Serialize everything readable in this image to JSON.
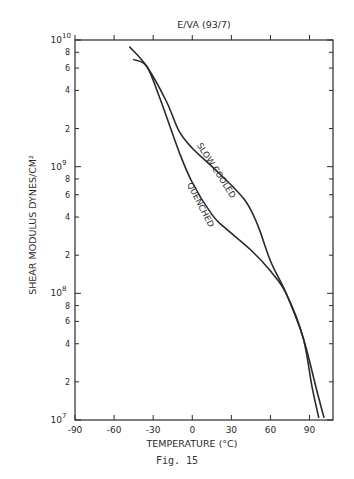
{
  "chart_data": {
    "type": "line",
    "title": "E/VA (93/7)",
    "xlabel": "TEMPERATURE (°C)",
    "ylabel": "SHEAR MODULUS DYNES/CM²",
    "xlim": [
      -90,
      108
    ],
    "ylim": [
      10000000.0,
      10000000000.0
    ],
    "yscale": "log",
    "grid": false,
    "x_ticks": [
      "-90",
      "-60",
      "-30",
      "0",
      "30",
      "60",
      "90"
    ],
    "x_tick_values": [
      -90,
      -60,
      -30,
      0,
      30,
      60,
      90
    ],
    "y_major_ticks": [
      {
        "value": 10000000.0,
        "label": "10",
        "exp": "7"
      },
      {
        "value": 100000000.0,
        "label": "10",
        "exp": "8"
      },
      {
        "value": 1000000000.0,
        "label": "10",
        "exp": "9"
      },
      {
        "value": 10000000000.0,
        "label": "10",
        "exp": "10"
      }
    ],
    "y_minor_labels": [
      "2",
      "4",
      "6",
      "8"
    ],
    "series": [
      {
        "name": "SLOW COOLED",
        "points": [
          [
            -48,
            8800000000.0
          ],
          [
            -35,
            6200000000.0
          ],
          [
            -20,
            3300000000.0
          ],
          [
            -10,
            1900000000.0
          ],
          [
            0,
            1400000000.0
          ],
          [
            20,
            900000000.0
          ],
          [
            40,
            550000000.0
          ],
          [
            50,
            350000000.0
          ],
          [
            60,
            180000000.0
          ],
          [
            72,
            100000000.0
          ],
          [
            85,
            45000000.0
          ],
          [
            95,
            18000000.0
          ],
          [
            101,
            10500000.0
          ]
        ]
      },
      {
        "name": "QUENCHED",
        "points": [
          [
            -45,
            7000000000.0
          ],
          [
            -35,
            6200000000.0
          ],
          [
            -25,
            3500000000.0
          ],
          [
            -10,
            1300000000.0
          ],
          [
            0,
            750000000.0
          ],
          [
            15,
            420000000.0
          ],
          [
            25,
            330000000.0
          ],
          [
            45,
            220000000.0
          ],
          [
            60,
            150000000.0
          ],
          [
            72,
            100000000.0
          ],
          [
            85,
            45000000.0
          ],
          [
            92,
            18000000.0
          ],
          [
            97,
            10500000.0
          ]
        ]
      }
    ],
    "annotations": [
      {
        "text": "SLOW COOLED",
        "near_series": "SLOW COOLED"
      },
      {
        "text": "QUENCHED",
        "near_series": "QUENCHED"
      }
    ]
  },
  "caption": "Fig. 15",
  "style": {
    "ink": "#2a2a2a",
    "background": "#ffffff"
  }
}
